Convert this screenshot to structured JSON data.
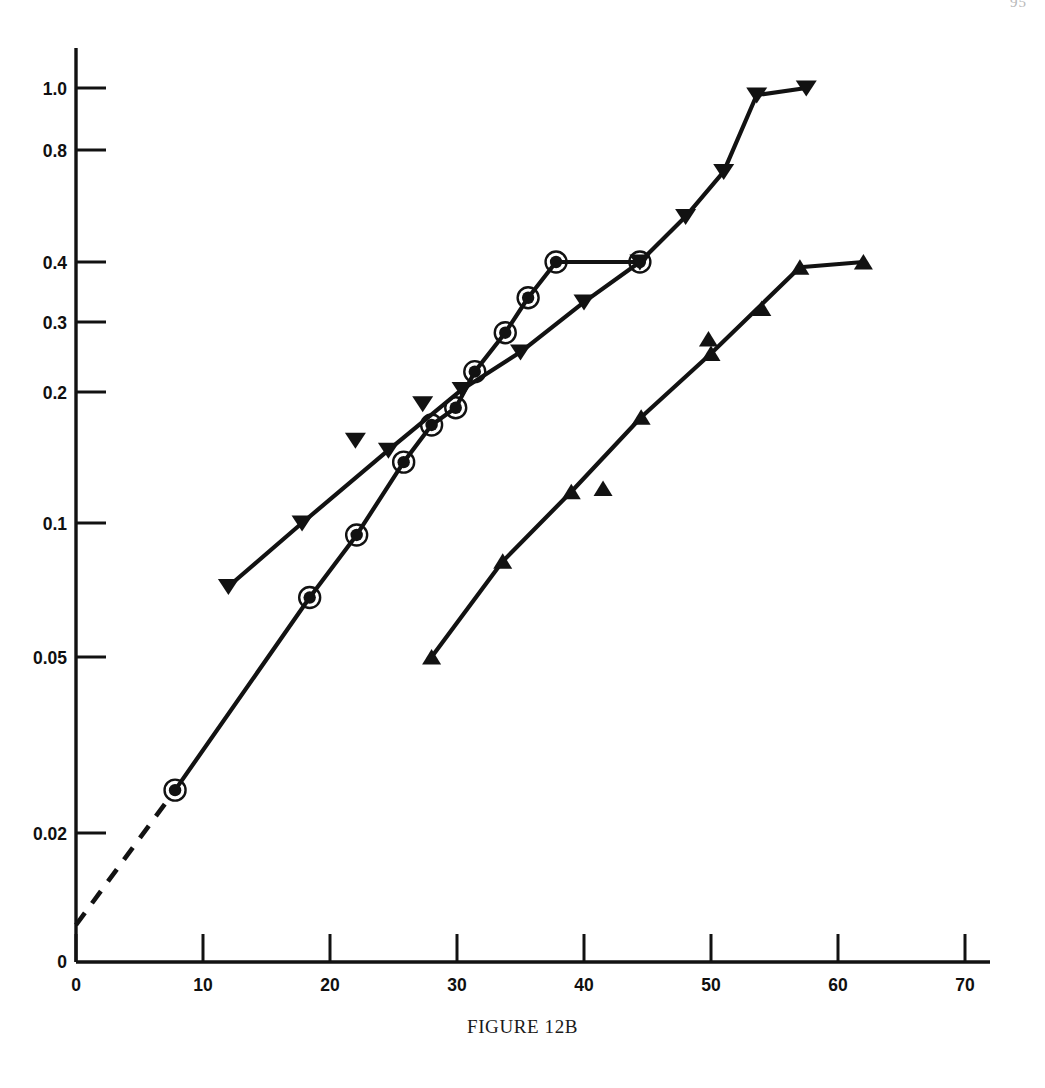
{
  "page": {
    "number_fragment": "95",
    "caption": "FIGURE 12B"
  },
  "chart_data": {
    "type": "line",
    "title": "FIGURE 12B",
    "xlabel": "",
    "ylabel": "",
    "xlim": [
      0,
      73
    ],
    "ylim": [
      0,
      1.05
    ],
    "yscale": "log-probability",
    "grid": false,
    "legend_position": "none",
    "xticks": [
      0,
      10,
      20,
      30,
      40,
      50,
      60,
      70
    ],
    "xtick_labels": [
      "0",
      "10",
      "20",
      "30",
      "40",
      "50",
      "60",
      "70"
    ],
    "yticks": [
      0,
      0.02,
      0.05,
      0.1,
      0.2,
      0.3,
      0.4,
      0.8,
      1.0
    ],
    "ytick_labels": [
      "0",
      "0.02",
      "0.05",
      "0.1",
      "0.2",
      "0.3",
      "0.4",
      "0.8",
      "1.0"
    ],
    "series": [
      {
        "name": "circled-dot-series",
        "marker": "circled-dot",
        "linestyle": "solid-with-dashed-extrapolation",
        "x": [
          7.8,
          18.4,
          22.1,
          25.8,
          28.0,
          29.9,
          31.4,
          33.8,
          35.6,
          37.8,
          44.4
        ],
        "y": [
          0.025,
          0.068,
          0.094,
          0.138,
          0.168,
          0.184,
          0.225,
          0.282,
          0.337,
          0.4,
          0.4
        ],
        "dashed_segment": {
          "x": [
            0.0,
            7.8
          ],
          "y": [
            0.0105,
            0.025
          ]
        }
      },
      {
        "name": "down-triangle-series",
        "marker": "triangle-down",
        "linestyle": "solid",
        "x": [
          12.0,
          17.8,
          24.6,
          30.4,
          35.0,
          40.0,
          44.4,
          48.0,
          51.0,
          53.6,
          57.5
        ],
        "y": [
          0.072,
          0.1,
          0.147,
          0.203,
          0.252,
          0.33,
          0.4,
          0.53,
          0.7,
          0.975,
          1.0
        ],
        "unconnected_points": {
          "x": [
            22.0,
            27.3
          ],
          "y": [
            0.155,
            0.188
          ]
        }
      },
      {
        "name": "up-triangle-series",
        "marker": "triangle-up",
        "linestyle": "solid",
        "x": [
          28.0,
          33.6,
          39.0,
          44.5,
          50.0,
          57.0,
          62.0
        ],
        "y": [
          0.05,
          0.082,
          0.118,
          0.175,
          0.25,
          0.39,
          0.4
        ],
        "unconnected_points": {
          "x": [
            41.5,
            49.8,
            54.0
          ],
          "y": [
            0.12,
            0.272,
            0.32
          ]
        }
      }
    ]
  },
  "axes": {
    "y_axis_name": "y-axis",
    "x_axis_name": "x-axis"
  },
  "colors": {
    "ink": "#121212",
    "background": "#ffffff",
    "page_number": "#b9b9b9"
  }
}
